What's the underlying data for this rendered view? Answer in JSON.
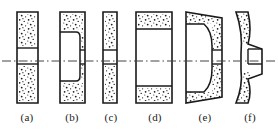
{
  "figure": {
    "type": "technical-line-drawing",
    "width": 278,
    "height": 136,
    "background_color": "#ffffff",
    "line_color": "#1a1a1a",
    "fill_pattern": "stipple",
    "axis": {
      "name": "center-axis",
      "style": "dash-dot",
      "y": 61,
      "x_start": 2,
      "x_end": 276,
      "color": "#444444"
    },
    "labels": [
      {
        "text": "(a)",
        "x": 27
      },
      {
        "text": "(b)",
        "x": 72
      },
      {
        "text": "(c)",
        "x": 111
      },
      {
        "text": "(d)",
        "x": 155
      },
      {
        "text": "(e)",
        "x": 205
      },
      {
        "text": "(f)",
        "x": 250
      }
    ],
    "shapes": [
      {
        "id": "a",
        "name": "straight-wheel",
        "outline": "M17,12 L38,12 L38,103 L17,103 Z",
        "hub_band": {
          "x": 17,
          "y": 48,
          "w": 21,
          "h": 16
        },
        "stipple_regions": [
          {
            "x": 19,
            "y": 14,
            "w": 17,
            "h": 32
          },
          {
            "x": 19,
            "y": 66,
            "w": 17,
            "h": 35
          }
        ]
      },
      {
        "id": "b",
        "name": "recessed-one-side-wheel",
        "outline": "M60,12 L85,12 L85,103 L60,103 Z",
        "recess": "M60,32 L76,32 Q80,32 80,37 L80,76 Q80,81 76,81 L60,81",
        "hub_band": {
          "x": 80,
          "y": 50,
          "w": 5,
          "h": 14
        },
        "stipple_regions": [
          {
            "x": 62,
            "y": 14,
            "w": 21,
            "h": 16
          },
          {
            "x": 81,
            "y": 32,
            "w": 3,
            "h": 17
          },
          {
            "x": 81,
            "y": 65,
            "w": 3,
            "h": 15
          },
          {
            "x": 62,
            "y": 83,
            "w": 21,
            "h": 18
          }
        ]
      },
      {
        "id": "c",
        "name": "thin-straight-wheel",
        "outline": "M103,12 L117,12 L117,103 L103,103 Z",
        "hub_band": {
          "x": 103,
          "y": 50,
          "w": 14,
          "h": 14
        },
        "stipple_regions": [
          {
            "x": 105,
            "y": 14,
            "w": 10,
            "h": 34
          },
          {
            "x": 105,
            "y": 66,
            "w": 10,
            "h": 35
          }
        ]
      },
      {
        "id": "d",
        "name": "wide-recessed-wheel",
        "outline": "M136,12 L172,12 L172,103 L136,103 Z",
        "hub_band": {
          "x": 136,
          "y": 29,
          "w": 36,
          "h": 57
        },
        "stipple_regions": [
          {
            "x": 138,
            "y": 14,
            "w": 32,
            "h": 13
          },
          {
            "x": 138,
            "y": 88,
            "w": 32,
            "h": 13
          }
        ]
      },
      {
        "id": "e",
        "name": "tapered-recessed-wheel",
        "outline": "M186,12 L222,18 L222,97 L186,103 Z",
        "recess": "M186,24 L205,24 Q212,30 212,45 L212,70 Q212,86 205,92 L186,92",
        "hub_band": {
          "x": 212,
          "y": 50,
          "w": 10,
          "h": 14
        },
        "stipple_regions": [
          {
            "x": 188,
            "y": 14,
            "w": 30,
            "h": 9
          },
          {
            "x": 213,
            "y": 26,
            "w": 8,
            "h": 22
          },
          {
            "x": 213,
            "y": 66,
            "w": 8,
            "h": 22
          },
          {
            "x": 188,
            "y": 93,
            "w": 30,
            "h": 9
          }
        ]
      },
      {
        "id": "f",
        "name": "dish-wheel",
        "outline": "M236,12 L248,12 Q252,30 248,44 L262,49 L262,74 L248,79 Q252,93 248,103 L236,103 Q243,86 241,70 L241,54 Q243,32 236,12 Z",
        "hub_band": {
          "x": 248,
          "y": 50,
          "w": 14,
          "h": 14
        },
        "stipple_regions": [
          {
            "x": 238,
            "y": 15,
            "w": 10,
            "h": 28
          },
          {
            "x": 238,
            "y": 72,
            "w": 10,
            "h": 28
          }
        ]
      }
    ]
  }
}
